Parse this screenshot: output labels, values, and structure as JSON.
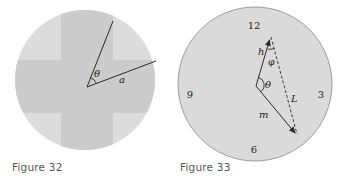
{
  "figures": [
    {
      "caption": "Figure 32",
      "labels": {
        "angle": "θ",
        "side": "a"
      },
      "colors": {
        "disc": "#dcdcdc",
        "cross": "#cbcbcb",
        "line": "#2a2a2a"
      }
    },
    {
      "caption": "Figure 33",
      "clock_numbers": {
        "twelve": "12",
        "three": "3",
        "six": "6",
        "nine": "9"
      },
      "labels": {
        "hour": "h",
        "minute": "m",
        "distance": "L",
        "theta": "θ",
        "phi": "φ"
      },
      "colors": {
        "face": "#dadada",
        "rim": "#888888",
        "line": "#2a2a2a"
      }
    }
  ]
}
